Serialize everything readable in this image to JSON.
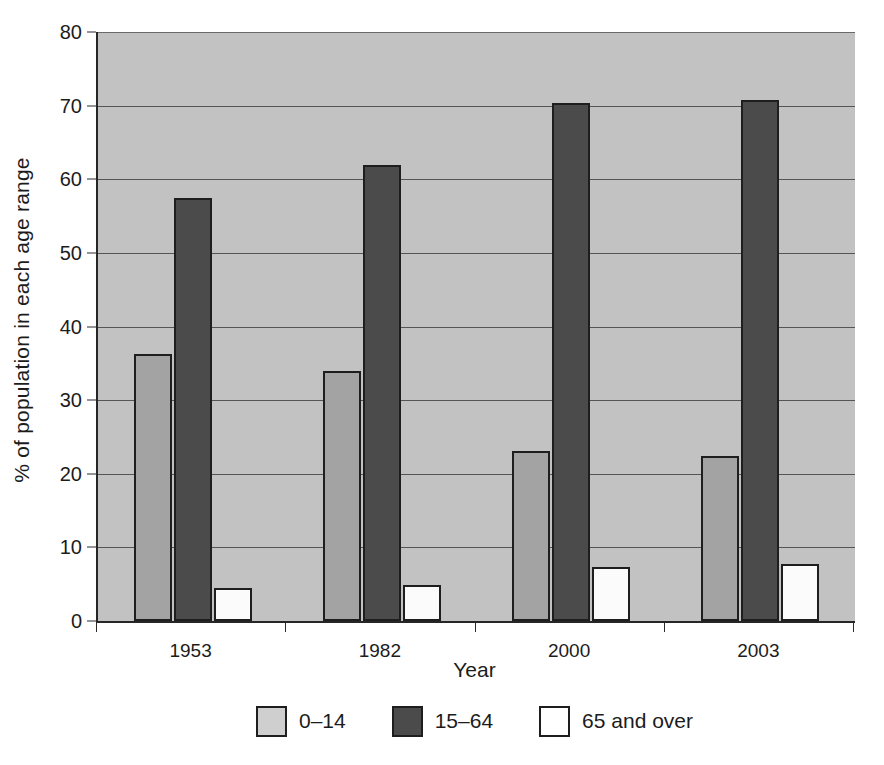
{
  "chart_data": {
    "type": "bar",
    "title": "",
    "subtitle": "",
    "xlabel": "Year",
    "ylabel": "% of population in each age range",
    "categories": [
      "1953",
      "1982",
      "2000",
      "2003"
    ],
    "series": [
      {
        "name": "0–14",
        "color": "#a3a3a3",
        "legend_color": "#cfcfcf",
        "values": [
          36.3,
          34.0,
          23.1,
          22.4
        ]
      },
      {
        "name": "15–64",
        "color": "#4b4b4b",
        "legend_color": "#4b4b4b",
        "values": [
          57.4,
          62.0,
          70.3,
          70.8
        ]
      },
      {
        "name": "65 and over",
        "color": "#fbfbfb",
        "legend_color": "#ffffff",
        "values": [
          4.5,
          4.9,
          7.3,
          7.7
        ]
      }
    ],
    "ylim": [
      0,
      80
    ],
    "yticks": [
      0,
      10,
      20,
      30,
      40,
      50,
      60,
      70,
      80
    ],
    "ytick_labels": [
      "0",
      "10",
      "20",
      "30",
      "40",
      "50",
      "60",
      "70",
      "80"
    ],
    "grid": true,
    "grid_axis": "y",
    "legend_position": "bottom",
    "plot_background": "#c2c2c2",
    "figure_background": "#ffffff",
    "axis_color": "#262626",
    "gridline_color": "#555555"
  }
}
